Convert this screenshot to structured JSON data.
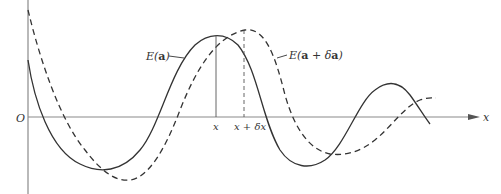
{
  "diagram": {
    "origin_label": "O",
    "x_axis_label": "x",
    "curve_solid": {
      "label_prefix": "E(",
      "label_bold": "a",
      "label_suffix": ")",
      "style": "solid"
    },
    "curve_dashed": {
      "label_prefix": "E(",
      "label_bold": "a",
      "label_mid": " + δ",
      "label_bold2": "a",
      "label_suffix": ")",
      "style": "dashed"
    },
    "tick_x": "x",
    "tick_x_plus_dx": "x + δx",
    "colors": {
      "line": "#333333",
      "axis": "#888888",
      "background": "#ffffff"
    }
  }
}
